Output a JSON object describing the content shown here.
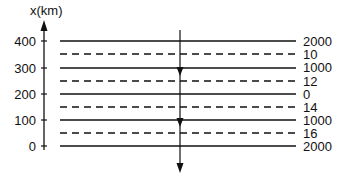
{
  "diagram": {
    "axis": {
      "title": "x(km)",
      "ticks": [
        {
          "label": "400",
          "value": 400
        },
        {
          "label": "300",
          "value": 300
        },
        {
          "label": "200",
          "value": 200
        },
        {
          "label": "100",
          "value": 100
        },
        {
          "label": "0",
          "value": 0
        }
      ]
    },
    "layers": [
      {
        "style": "solid",
        "x_km": 400,
        "label": "2000"
      },
      {
        "style": "dashed",
        "x_km": 350,
        "label": "10"
      },
      {
        "style": "solid",
        "x_km": 300,
        "label": "1000"
      },
      {
        "style": "dashed",
        "x_km": 250,
        "label": "12"
      },
      {
        "style": "solid",
        "x_km": 200,
        "label": "0"
      },
      {
        "style": "dashed",
        "x_km": 150,
        "label": "14"
      },
      {
        "style": "solid",
        "x_km": 100,
        "label": "1000"
      },
      {
        "style": "dashed",
        "x_km": 50,
        "label": "16"
      },
      {
        "style": "solid",
        "x_km": 0,
        "label": "2000"
      }
    ],
    "ray": {
      "direction": "downward",
      "arrowheads": 3
    },
    "colors": {
      "line": "#111111",
      "background": "#ffffff"
    }
  }
}
